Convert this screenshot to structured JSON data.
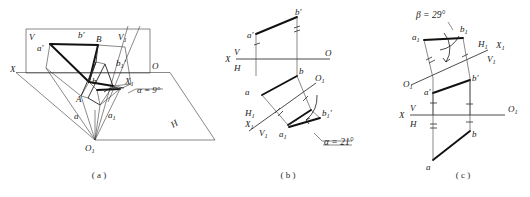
{
  "figure": {
    "ink_color": "#1a1a1a",
    "background_color": "#ffffff"
  },
  "panels": [
    {
      "id": "a",
      "caption": "( a )",
      "type": "pictorial-3d",
      "description": "Pictorial view of V and H projection planes with auxiliary plane V1",
      "labels": {
        "plane_v": "V",
        "plane_h": "H",
        "plane_v1": "V1",
        "axis_x": "X",
        "axis_o": "O",
        "axis_x1": "X1",
        "axis_o1": "O1",
        "point_A": "A",
        "point_B": "B",
        "point_a_prime": "a'",
        "point_b_prime": "b'",
        "point_a": "a",
        "point_b": "b",
        "point_a1": "a1",
        "point_b1_prime": "b1'",
        "angle": "α = 9°"
      }
    },
    {
      "id": "b",
      "caption": "( b )",
      "type": "orthographic-projection",
      "description": "Two-view projection with auxiliary view giving true angle alpha to H plane",
      "labels": {
        "axis_left": "X",
        "axis_v": "V",
        "axis_h": "H",
        "axis_right": "O",
        "aux_x1": "X1",
        "aux_v1": "V1",
        "aux_h1": "H1",
        "aux_o1": "O1",
        "point_a_prime": "a'",
        "point_b_prime": "b'",
        "point_a": "a",
        "point_b": "b",
        "point_a1": "a1",
        "point_b1_prime": "b1'",
        "angle": "α = 21°"
      }
    },
    {
      "id": "c",
      "caption": "( c )",
      "type": "orthographic-projection",
      "description": "Two-view projection with auxiliary view giving true angle beta to V plane",
      "labels": {
        "axis_left": "X",
        "axis_v": "V",
        "axis_h": "H",
        "axis_right": "O1",
        "aux_x1": "X1",
        "aux_v1": "V1",
        "aux_h1": "H1",
        "aux_o1": "O1",
        "point_a_prime": "a'",
        "point_b_prime": "b'",
        "point_a": "a",
        "point_b": "b",
        "point_a1": "a1",
        "point_b1": "b1",
        "angle": "β = 29°"
      }
    }
  ]
}
